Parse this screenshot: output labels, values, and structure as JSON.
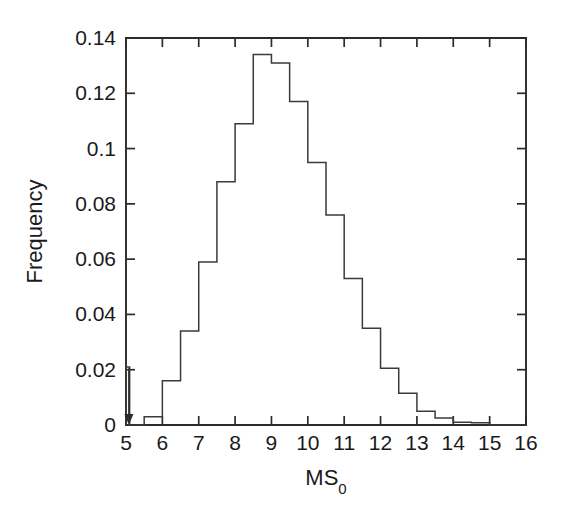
{
  "figure": {
    "background_color": "#ffffff",
    "line_color": "#3a3a3a",
    "axis_color": "#2b2b2b"
  },
  "axes": {
    "x_title_main": "MS",
    "x_title_sub": "0",
    "y_title": "Frequency",
    "x_tick_labels": [
      "5",
      "6",
      "7",
      "8",
      "9",
      "10",
      "11",
      "12",
      "13",
      "14",
      "15",
      "16"
    ],
    "y_tick_labels": [
      "0",
      "0.02",
      "0.04",
      "0.06",
      "0.08",
      "0.1",
      "0.12",
      "0.14"
    ]
  },
  "annotations": {
    "threshold_arrow": {
      "name": "completeness-threshold-arrow",
      "x": 5.08,
      "y_top": 0.0205,
      "y_bottom": 0.0
    }
  },
  "chart_data": {
    "type": "bar",
    "title": "",
    "subtitle": "",
    "xlabel": "MS_0",
    "ylabel": "Frequency",
    "xlim": [
      5,
      16
    ],
    "ylim": [
      0,
      0.14
    ],
    "x_ticks": [
      5,
      6,
      7,
      8,
      9,
      10,
      11,
      12,
      13,
      14,
      15,
      16
    ],
    "y_ticks": [
      0,
      0.02,
      0.04,
      0.06,
      0.08,
      0.1,
      0.12,
      0.14
    ],
    "grid": false,
    "legend": null,
    "bin_width": 0.5,
    "bin_edges": [
      5.0,
      5.1,
      5.5,
      6.0,
      6.5,
      7.0,
      7.5,
      8.0,
      8.5,
      9.0,
      9.5,
      10.0,
      10.5,
      11.0,
      11.5,
      12.0,
      12.5,
      13.0,
      13.5,
      14.0,
      14.5,
      15.0,
      16.0
    ],
    "categories": [
      "5.0-5.1",
      "5.1-5.5",
      "5.5-6.0",
      "6.0-6.5",
      "6.5-7.0",
      "7.0-7.5",
      "7.5-8.0",
      "8.0-8.5",
      "8.5-9.0",
      "9.0-9.5",
      "9.5-10.0",
      "10.0-10.5",
      "10.5-11.0",
      "11.0-11.5",
      "11.5-12.0",
      "12.0-12.5",
      "12.5-13.0",
      "13.0-13.5",
      "13.5-14.0",
      "14.0-14.5",
      "14.5-15.0",
      "15.0-16.0"
    ],
    "values": [
      0.021,
      0.0,
      0.003,
      0.016,
      0.034,
      0.059,
      0.088,
      0.109,
      0.134,
      0.131,
      0.117,
      0.095,
      0.076,
      0.053,
      0.035,
      0.0205,
      0.0115,
      0.005,
      0.0025,
      0.001,
      0.0008,
      0.0
    ]
  }
}
